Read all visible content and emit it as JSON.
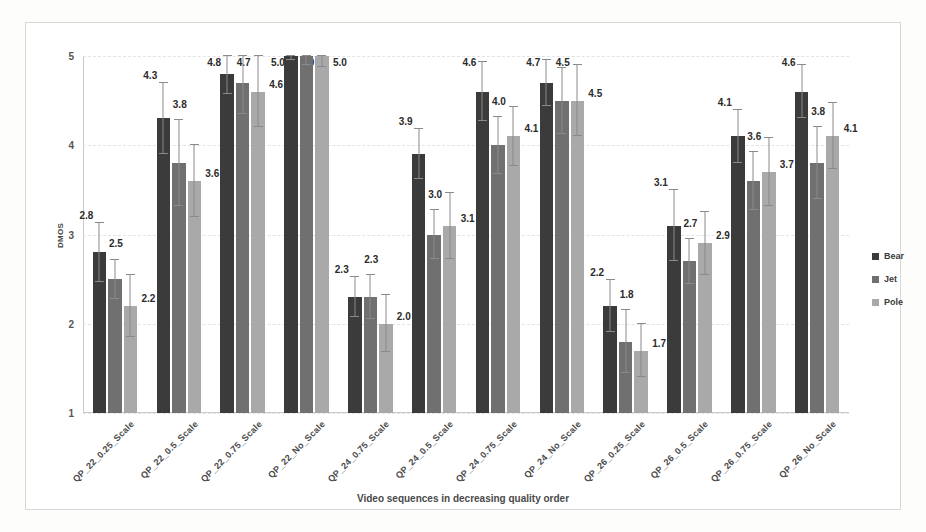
{
  "chart_data": {
    "type": "bar",
    "title": "",
    "xlabel": "Video sequences in decreasing quality order",
    "ylabel": "DMOS",
    "ylim": [
      1,
      5
    ],
    "yticks": [
      "1",
      "2",
      "3",
      "4",
      "5"
    ],
    "grid": true,
    "legend_position": "right",
    "orientation": "vertical-grouped",
    "error_bars": true,
    "categories": [
      "QP_22_0.25_Scale",
      "QP_22_0.5_Scale",
      "QP_22_0.75_Scale",
      "QP_22_No_Scale",
      "QP_24_0.75_Scale",
      "QP_24_0.5_Scale",
      "QP_24_0.75_Scale",
      "QP_24_No_Scale",
      "QP_26_0.25_Scale",
      "QP_26_0.5_Scale",
      "QP_26_0.75_Scale",
      "QP_26_No_Scale"
    ],
    "series": [
      {
        "name": "Bear",
        "color": "#3b3b3b",
        "values": [
          2.8,
          4.3,
          4.8,
          5.0,
          2.3,
          3.9,
          4.6,
          4.7,
          2.2,
          3.1,
          4.1,
          4.6
        ],
        "errors": [
          0.33,
          0.4,
          0.22,
          0.05,
          0.22,
          0.28,
          0.33,
          0.26,
          0.29,
          0.4,
          0.3,
          0.3
        ]
      },
      {
        "name": "Jet",
        "color": "#707070",
        "values": [
          2.5,
          3.8,
          4.7,
          5.0,
          2.3,
          3.0,
          4.0,
          4.5,
          1.8,
          2.7,
          3.6,
          3.8
        ],
        "errors": [
          0.22,
          0.48,
          0.35,
          0.1,
          0.25,
          0.27,
          0.32,
          0.37,
          0.35,
          0.25,
          0.32,
          0.4
        ]
      },
      {
        "name": "Pole",
        "color": "#a9a9a9",
        "values": [
          2.2,
          3.6,
          4.6,
          5.0,
          2.0,
          3.1,
          4.1,
          4.5,
          1.7,
          2.9,
          3.7,
          4.1
        ],
        "errors": [
          0.35,
          0.4,
          0.4,
          0.12,
          0.32,
          0.37,
          0.33,
          0.4,
          0.3,
          0.35,
          0.38,
          0.37
        ]
      }
    ],
    "data_labels": [
      [
        "2.8",
        "2.5",
        "2.2"
      ],
      [
        "4.3",
        "3.8",
        "3.6"
      ],
      [
        "4.8",
        "4.7",
        "4.6"
      ],
      [
        "5.0",
        "5.0",
        "5.0"
      ],
      [
        "2.3",
        "2.3",
        "2.0"
      ],
      [
        "3.9",
        "3.0",
        "3.1"
      ],
      [
        "4.6",
        "4.0",
        "4.1"
      ],
      [
        "4.7",
        "4.5",
        "4.5"
      ],
      [
        "2.2",
        "1.8",
        "1.7"
      ],
      [
        "3.1",
        "2.7",
        "2.9"
      ],
      [
        "4.1",
        "3.6",
        "3.7"
      ],
      [
        "4.6",
        "3.8",
        "4.1"
      ]
    ]
  },
  "legend": {
    "items": [
      {
        "label": "Bear",
        "color": "#3b3b3b"
      },
      {
        "label": "Jet",
        "color": "#707070"
      },
      {
        "label": "Pole",
        "color": "#a9a9a9"
      }
    ]
  }
}
